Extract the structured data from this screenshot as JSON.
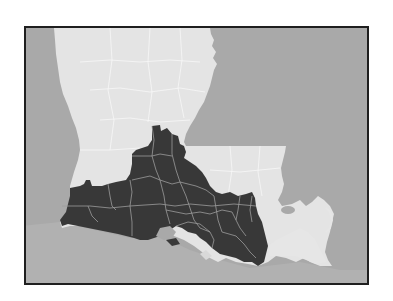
{
  "map": {
    "subject": "Louisiana parishes",
    "highlighted_region": "South Louisiana parishes (dark)",
    "colors": {
      "frame_border": "#1f1f1f",
      "water_background": "#a9a9a9",
      "state_land": "#e6e6e6",
      "highlighted_parishes": "#3a3a3a",
      "parish_borders": "#bdbdbd",
      "gulf_water": "#b3b3b3"
    },
    "legend": []
  }
}
